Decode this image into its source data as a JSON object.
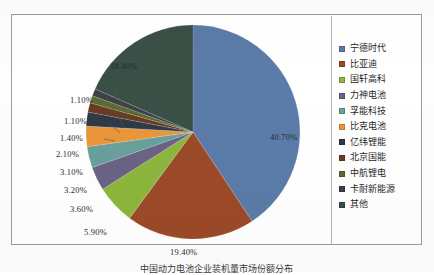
{
  "chart_data": {
    "type": "pie",
    "title": "",
    "categories": [
      "宁德时代",
      "比亚迪",
      "国轩高科",
      "力神电池",
      "孚能科技",
      "比克电池",
      "亿纬锂能",
      "北京国能",
      "中航锂电",
      "卡耐新能源",
      "其他"
    ],
    "values": [
      40.7,
      19.4,
      5.9,
      3.6,
      3.2,
      3.1,
      2.1,
      1.4,
      1.1,
      1.1,
      18.4
    ],
    "value_labels": [
      "40.70%",
      "19.40%",
      "5.90%",
      "3.60%",
      "3.20%",
      "3.10%",
      "2.10%",
      "1.40%",
      "1.10%",
      "1.10%",
      "18.40%"
    ],
    "unit": "%",
    "colors": [
      "#5b7ba8",
      "#9c4a28",
      "#8cb63c",
      "#6b6384",
      "#69a09c",
      "#e9963c",
      "#2f3a49",
      "#6a3a22",
      "#5d6b31",
      "#3d4249",
      "#3a4f46"
    ],
    "legend_position": "right",
    "grid": false,
    "labels_shown": true
  },
  "legend": {
    "items": [
      {
        "label": "宁德时代",
        "color": "#5b7ba8"
      },
      {
        "label": "比亚迪",
        "color": "#9c4a28"
      },
      {
        "label": "国轩高科",
        "color": "#8cb63c"
      },
      {
        "label": "力神电池",
        "color": "#6b6384"
      },
      {
        "label": "孚能科技",
        "color": "#69a09c"
      },
      {
        "label": "比克电池",
        "color": "#e9963c"
      },
      {
        "label": "亿纬锂能",
        "color": "#2f3a49"
      },
      {
        "label": "北京国能",
        "color": "#6a3a22"
      },
      {
        "label": "中航锂电",
        "color": "#5d6b31"
      },
      {
        "label": "卡耐新能源",
        "color": "#3d4249"
      },
      {
        "label": "其他",
        "color": "#3a4f46"
      }
    ]
  },
  "callouts": [
    {
      "text": "40.70%",
      "x": 258,
      "y": 117
    },
    {
      "text": "19.40%",
      "x": 158,
      "y": 232
    },
    {
      "text": "5.90%",
      "x": 72,
      "y": 212
    },
    {
      "text": "3.60%",
      "x": 58,
      "y": 189
    },
    {
      "text": "3.20%",
      "x": 52,
      "y": 170
    },
    {
      "text": "3.10%",
      "x": 48,
      "y": 152
    },
    {
      "text": "2.10%",
      "x": 44,
      "y": 134
    },
    {
      "text": "1.40%",
      "x": 48,
      "y": 118
    },
    {
      "text": "1.10%",
      "x": 52,
      "y": 101
    },
    {
      "text": "1.10%",
      "x": 58,
      "y": 80
    },
    {
      "text": "18.40%",
      "x": 98,
      "y": 46
    }
  ],
  "caption": {
    "text": "中国动力电池企业装机量市场份额分布"
  }
}
